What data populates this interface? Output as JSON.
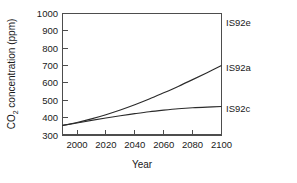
{
  "chart_data": {
    "type": "line",
    "title": "",
    "xlabel": "Year",
    "ylabel_parts": {
      "pre": "CO",
      "sub": "2",
      "post": " concentration (ppm)"
    },
    "ylabel": "CO2 concentration (ppm)",
    "xlim": [
      1990,
      2100
    ],
    "ylim": [
      300,
      1000
    ],
    "ytick_labels": [
      "1000",
      "900",
      "800",
      "700",
      "600",
      "500",
      "400",
      "300"
    ],
    "ytick_values": [
      1000,
      900,
      800,
      700,
      600,
      500,
      400,
      300
    ],
    "xtick_labels": [
      "2000",
      "2020",
      "2040",
      "2060",
      "2080",
      "2100"
    ],
    "xtick_values": [
      2000,
      2020,
      2040,
      2060,
      2080,
      2100
    ],
    "grid": false,
    "legend_position": "right-of-axes-at-line-end",
    "x": [
      1990,
      2000,
      2010,
      2020,
      2030,
      2040,
      2050,
      2060,
      2070,
      2080,
      2090,
      2100
    ],
    "series": [
      {
        "name": "IS92e",
        "label": "IS92e",
        "color": "#2b2b2b",
        "end_value": 958,
        "values": [
          355,
          375,
          400,
          432,
          470,
          515,
          567,
          628,
          698,
          778,
          865,
          958
        ]
      },
      {
        "name": "IS92a",
        "label": "IS92a",
        "color": "#2b2b2b",
        "end_value": 700,
        "values": [
          355,
          372,
          393,
          417,
          444,
          474,
          507,
          543,
          580,
          619,
          659,
          700
        ]
      },
      {
        "name": "IS92c",
        "label": "IS92c",
        "color": "#2b2b2b",
        "end_value": 464,
        "values": [
          355,
          369,
          384,
          398,
          411,
          423,
          434,
          443,
          451,
          457,
          461,
          464
        ]
      }
    ]
  },
  "figure": {
    "background_color": "#ffffff",
    "axis_color": "#4d4d4d",
    "text_color": "#1a1a1a"
  }
}
